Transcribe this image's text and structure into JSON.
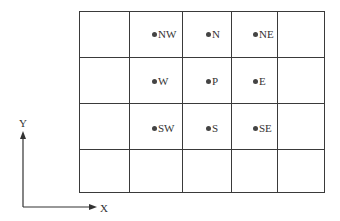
{
  "grid": {
    "cols_x": [
      79,
      129,
      182,
      231,
      277,
      324
    ],
    "rows_y": [
      11,
      57,
      103,
      149,
      192
    ]
  },
  "nodes": [
    {
      "label": "NW",
      "x": 152,
      "y": 28
    },
    {
      "label": "N",
      "x": 206,
      "y": 28
    },
    {
      "label": "NE",
      "x": 253,
      "y": 28
    },
    {
      "label": "W",
      "x": 152,
      "y": 75
    },
    {
      "label": "P",
      "x": 206,
      "y": 75
    },
    {
      "label": "E",
      "x": 253,
      "y": 75
    },
    {
      "label": "SW",
      "x": 152,
      "y": 122
    },
    {
      "label": "S",
      "x": 206,
      "y": 122
    },
    {
      "label": "SE",
      "x": 253,
      "y": 122
    }
  ],
  "axes": {
    "x_label": "X",
    "y_label": "Y"
  }
}
